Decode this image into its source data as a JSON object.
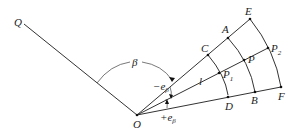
{
  "diagram": {
    "type": "geometry-figure",
    "background": "#ffffff",
    "stroke_color": "#333333",
    "points": {
      "Q": {
        "label": "Q"
      },
      "O": {
        "label": "O"
      },
      "A": {
        "label": "A"
      },
      "B": {
        "label": "B"
      },
      "C": {
        "label": "C"
      },
      "D": {
        "label": "D"
      },
      "E": {
        "label": "E"
      },
      "F": {
        "label": "F"
      },
      "P": {
        "label": "P"
      },
      "P1": {
        "label": "P",
        "subscript": "1"
      },
      "P2": {
        "label": "P",
        "subscript": "2"
      }
    },
    "angles": {
      "beta": {
        "label": "β"
      },
      "minus_eps": {
        "label": "−e",
        "subscript": "β"
      },
      "plus_eps": {
        "label": "+e",
        "subscript": "β"
      }
    },
    "segment_labels": {
      "l": {
        "label": "l"
      }
    },
    "rays": [
      "O-Q",
      "O-E",
      "O-P2",
      "O-F"
    ],
    "arcs": [
      "C-D",
      "A-B",
      "E-F"
    ]
  }
}
